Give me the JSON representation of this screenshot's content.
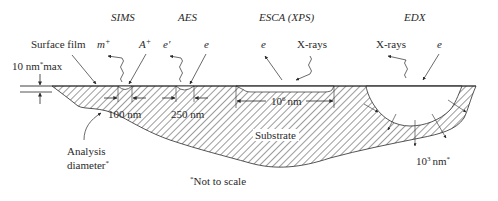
{
  "techniques": [
    {
      "name": "SIMS",
      "signals": [
        {
          "label": "m",
          "sup": "+",
          "kind": "out-wavy"
        },
        {
          "label": "A",
          "sup": "+",
          "kind": "in"
        }
      ],
      "analysis_width": "100 nm"
    },
    {
      "name": "AES",
      "signals": [
        {
          "label": "e",
          "sup": "′",
          "kind": "out-wavy"
        },
        {
          "label": "e",
          "sup": "",
          "kind": "in"
        }
      ],
      "analysis_width": "250 nm"
    },
    {
      "name": "ESCA (XPS)",
      "signals": [
        {
          "label": "e",
          "sup": "",
          "kind": "out"
        },
        {
          "label": "X-rays",
          "sup": "",
          "kind": "in-wavy"
        }
      ],
      "analysis_width_base": "10",
      "analysis_width_exp": "6",
      "analysis_width_unit": "nm"
    },
    {
      "name": "EDX",
      "signals": [
        {
          "label": "X-rays",
          "sup": "",
          "kind": "out-wavy"
        },
        {
          "label": "e",
          "sup": "",
          "kind": "in"
        }
      ],
      "depth_base": "10",
      "depth_exp": "3",
      "depth_unit": "nm",
      "depth_mark": "*"
    }
  ],
  "labels": {
    "surface_film": "Surface film",
    "film_thickness": "10 nm",
    "film_thickness_mark": "*",
    "film_thickness_suffix": "max",
    "analysis_diameter_line1": "Analysis",
    "analysis_diameter_line2": "diameter",
    "analysis_diameter_mark": "*",
    "substrate": "Substrate",
    "footnote_mark": "*",
    "footnote": "Not to scale"
  },
  "colors": {
    "line": "#2a2a2a",
    "hatch": "#3a3a3a",
    "background": "#ffffff"
  }
}
